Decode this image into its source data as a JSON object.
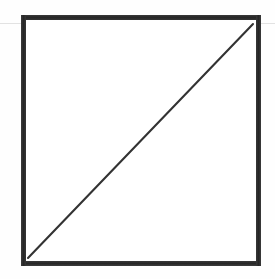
{
  "figure": {
    "kind": "geometric-line-diagram",
    "canvas": {
      "width": 275,
      "height": 279,
      "background_color": "#fefefe"
    },
    "labels": {
      "title": "",
      "caption": "",
      "annotations": []
    },
    "shapes": {
      "square_frame": {
        "name": "square-outline",
        "stroke_color": "#2d2d2d",
        "stroke_width": 5,
        "fill_color": "#ffffff",
        "left": 21,
        "top": 15,
        "width": 240,
        "height": 251
      },
      "diagonal_line": {
        "name": "diagonal-line",
        "stroke_color": "#333333",
        "stroke_width": 2.1,
        "x1": 28,
        "y1": 258,
        "x2": 253,
        "y2": 24,
        "direction": "lower-left to upper-right"
      },
      "scan_artifact_line": {
        "name": "horizontal-scan-line",
        "stroke_color": "#e2e2e2",
        "stroke_width": 1,
        "y": 23,
        "x_start": 0,
        "x_end": 275
      }
    }
  }
}
